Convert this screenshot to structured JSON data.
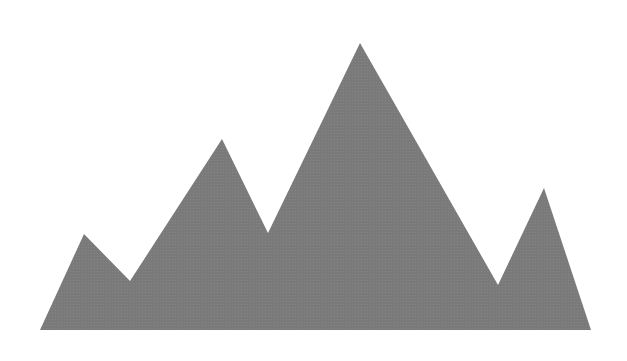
{
  "graphic": {
    "subject": "mountain-range-silhouette",
    "fill_color": "#7a7a7a",
    "texture_dot_color": "#8a8a8a",
    "background_color": "#ffffff",
    "points": "40,330 84,234 130,281 222,139 268,233 360,43 498,285 544,188 591,330"
  }
}
